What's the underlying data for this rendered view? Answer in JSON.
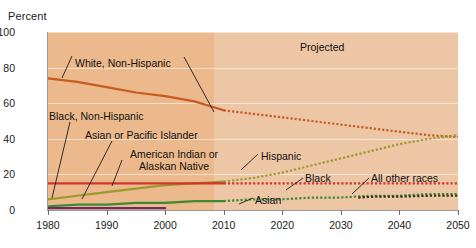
{
  "chart_data": {
    "type": "line",
    "title": "",
    "subtitle": "",
    "ylabel": "Percent",
    "xlabel": "",
    "ylim": [
      0,
      100
    ],
    "xlim": [
      1980,
      2050
    ],
    "yticks": [
      0,
      20,
      40,
      60,
      80,
      100
    ],
    "xticks": [
      1980,
      1990,
      2000,
      2010,
      2020,
      2030,
      2040,
      2050
    ],
    "grid": true,
    "legend_position": "inline-annotations",
    "projection_start": 2010,
    "annotations": [
      {
        "text": "Projected",
        "x": 2032,
        "y": 92
      },
      {
        "text": "White, Non-Hispanic",
        "x": 1993,
        "y": 84
      },
      {
        "text": "Black, Non-Hispanic",
        "x": 1983,
        "y": 56
      },
      {
        "text": "Asian or Pacific Islander",
        "x": 1993,
        "y": 45
      },
      {
        "text": "American Indian or Alaskan Native",
        "x": 1999,
        "y": 33
      },
      {
        "text": "Hispanic",
        "x": 2019,
        "y": 32
      },
      {
        "text": "Black",
        "x": 2030,
        "y": 22
      },
      {
        "text": "All other races",
        "x": 2043,
        "y": 22
      },
      {
        "text": "Asian",
        "x": 2022,
        "y": 11
      }
    ],
    "series": [
      {
        "name": "White, Non-Hispanic",
        "color": "#c75b23",
        "historical_style": "solid",
        "projected_style": "dotted",
        "x": [
          1980,
          1985,
          1990,
          1995,
          2000,
          2005,
          2010,
          2015,
          2020,
          2025,
          2030,
          2035,
          2040,
          2045,
          2050
        ],
        "values": [
          74,
          72,
          69,
          66,
          64,
          61,
          56,
          54,
          52,
          50,
          48,
          46,
          44,
          42,
          41
        ]
      },
      {
        "name": "Hispanic",
        "color": "#9a9a2e",
        "historical_style": "solid",
        "projected_style": "dotted",
        "x": [
          1980,
          1985,
          1990,
          1995,
          2000,
          2005,
          2010,
          2015,
          2020,
          2025,
          2030,
          2035,
          2040,
          2045,
          2050
        ],
        "values": [
          6,
          8,
          10,
          12,
          14,
          15,
          16,
          18,
          21,
          25,
          29,
          33,
          37,
          40,
          42
        ]
      },
      {
        "name": "Black, Non-Hispanic",
        "color": "#d1352b",
        "historical_style": "solid",
        "projected_style": "dotted",
        "x": [
          1980,
          1990,
          2000,
          2010,
          2020,
          2030,
          2040,
          2050
        ],
        "values": [
          15,
          15,
          15,
          15,
          15,
          15,
          15,
          15
        ]
      },
      {
        "name": "Asian or Pacific Islander",
        "color": "#3d8a32",
        "historical_style": "solid",
        "projected_style": "dotted",
        "x": [
          1980,
          1985,
          1990,
          1995,
          2000,
          2005,
          2010,
          2015,
          2020,
          2025,
          2030,
          2035,
          2040,
          2045,
          2050
        ],
        "values": [
          2,
          3,
          3,
          4,
          4,
          5,
          5,
          6,
          6,
          7,
          7,
          8,
          8,
          9,
          9
        ]
      },
      {
        "name": "American Indian or Alaskan Native",
        "color": "#6b2d6b",
        "historical_style": "solid",
        "projected_style": "none",
        "x": [
          1980,
          1985,
          1990,
          1995,
          2000
        ],
        "values": [
          1,
          1,
          1,
          1,
          1
        ]
      },
      {
        "name": "All other races",
        "color": "#3a2a20",
        "historical_style": "none",
        "projected_style": "dotted",
        "x": [
          2033,
          2036,
          2040,
          2045,
          2050
        ],
        "values": [
          7,
          7.5,
          7.5,
          8,
          8
        ]
      }
    ]
  }
}
